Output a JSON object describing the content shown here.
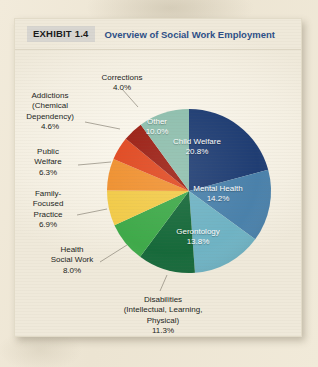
{
  "header": {
    "exhibit_badge": "EXHIBIT 1.4",
    "title": "Overview of Social Work Employment",
    "badge_bg": "#d8d6d1",
    "title_color": "#2d4f87"
  },
  "page": {
    "background": "#efe7d5",
    "card_background": "#f6f2e7"
  },
  "chart_data": {
    "type": "pie",
    "title": "Overview of Social Work Employment",
    "xlabel": "",
    "ylabel": "",
    "legend_position": "none",
    "grid": false,
    "start_angle_deg": 0,
    "direction": "clockwise",
    "categories": [
      "Child Welfare",
      "Mental Health",
      "Gerontology",
      "Disabilities (Intellectual, Learning, Physical)",
      "Health Social Work",
      "Family-Focused Practice",
      "Public Welfare",
      "Addictions (Chemical Dependency)",
      "Corrections",
      "Other"
    ],
    "values": [
      20.8,
      14.2,
      13.8,
      11.3,
      8.0,
      6.9,
      6.3,
      4.6,
      4.0,
      10.0
    ],
    "colors": [
      "#1f3d73",
      "#4a81ab",
      "#6fb3c4",
      "#16693a",
      "#3faa4a",
      "#f2cb4a",
      "#f09232",
      "#e14a22",
      "#9c2015",
      "#8fbfae"
    ],
    "slices": [
      {
        "label": "Child Welfare",
        "label_lines": [
          "Child Welfare"
        ],
        "value": 20.8,
        "value_text": "20.8%",
        "color": "#1f3d73",
        "label_placement": "inside",
        "label_color": "#ffffff"
      },
      {
        "label": "Mental Health",
        "label_lines": [
          "Mental Health"
        ],
        "value": 14.2,
        "value_text": "14.2%",
        "color": "#4a81ab",
        "label_placement": "inside",
        "label_color": "#ffffff"
      },
      {
        "label": "Gerontology",
        "label_lines": [
          "Gerontology"
        ],
        "value": 13.8,
        "value_text": "13.8%",
        "color": "#6fb3c4",
        "label_placement": "inside",
        "label_color": "#ffffff"
      },
      {
        "label": "Disabilities (Intellectual, Learning, Physical)",
        "label_lines": [
          "Disabilities",
          "(Intellectual, Learning,",
          "Physical)"
        ],
        "value": 11.3,
        "value_text": "11.3%",
        "color": "#16693a",
        "label_placement": "outside",
        "label_color": "#231f1c"
      },
      {
        "label": "Health Social Work",
        "label_lines": [
          "Health",
          "Social Work"
        ],
        "value": 8.0,
        "value_text": "8.0%",
        "color": "#3faa4a",
        "label_placement": "outside",
        "label_color": "#231f1c"
      },
      {
        "label": "Family-Focused Practice",
        "label_lines": [
          "Family-",
          "Focused",
          "Practice"
        ],
        "value": 6.9,
        "value_text": "6.9%",
        "color": "#f2cb4a",
        "label_placement": "outside",
        "label_color": "#231f1c"
      },
      {
        "label": "Public Welfare",
        "label_lines": [
          "Public",
          "Welfare"
        ],
        "value": 6.3,
        "value_text": "6.3%",
        "color": "#f09232",
        "label_placement": "outside",
        "label_color": "#231f1c"
      },
      {
        "label": "Addictions (Chemical Dependency)",
        "label_lines": [
          "Addictions",
          "(Chemical",
          "Dependency)"
        ],
        "value": 4.6,
        "value_text": "4.6%",
        "color": "#e14a22",
        "label_placement": "outside",
        "label_color": "#231f1c"
      },
      {
        "label": "Corrections",
        "label_lines": [
          "Corrections"
        ],
        "value": 4.0,
        "value_text": "4.0%",
        "color": "#9c2015",
        "label_placement": "outside",
        "label_color": "#231f1c"
      },
      {
        "label": "Other",
        "label_lines": [
          "Other"
        ],
        "value": 10.0,
        "value_text": "10.0%",
        "color": "#8fbfae",
        "label_placement": "inside",
        "label_color": "#ffffff"
      }
    ]
  },
  "labels": {
    "child_welfare_name": "Child Welfare",
    "child_welfare_value": "20.8%",
    "mental_health_name": "Mental Health",
    "mental_health_value": "14.2%",
    "gerontology_name": "Gerontology",
    "gerontology_value": "13.8%",
    "other_name": "Other",
    "other_value": "10.0%",
    "disabilities_l1": "Disabilities",
    "disabilities_l2": "(Intellectual, Learning,",
    "disabilities_l3": "Physical)",
    "disabilities_value": "11.3%",
    "health_l1": "Health",
    "health_l2": "Social Work",
    "health_value": "8.0%",
    "family_l1": "Family-",
    "family_l2": "Focused",
    "family_l3": "Practice",
    "family_value": "6.9%",
    "public_l1": "Public",
    "public_l2": "Welfare",
    "public_value": "6.3%",
    "addictions_l1": "Addictions",
    "addictions_l2": "(Chemical",
    "addictions_l3": "Dependency)",
    "addictions_value": "4.6%",
    "corrections_name": "Corrections",
    "corrections_value": "4.0%"
  }
}
